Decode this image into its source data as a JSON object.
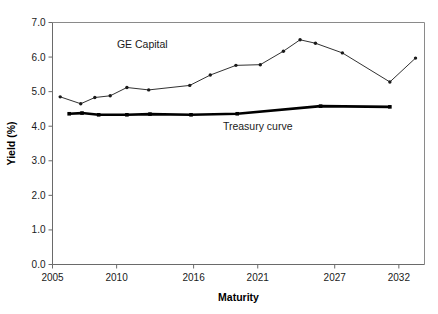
{
  "chart_data": {
    "type": "line",
    "title": "",
    "xlabel": "Maturity",
    "ylabel": "Yield (%)",
    "xlim": [
      2005,
      2034
    ],
    "ylim": [
      0.0,
      7.0
    ],
    "grid": false,
    "legend_position": "inline-annotations",
    "ytick_labels": [
      "0.0",
      "1.0",
      "2.0",
      "3.0",
      "4.0",
      "5.0",
      "6.0",
      "7.0"
    ],
    "ytick_values": [
      0.0,
      1.0,
      2.0,
      3.0,
      4.0,
      5.0,
      6.0,
      7.0
    ],
    "xtick_labels": [
      "2005",
      "2010",
      "2016",
      "2021",
      "2027",
      "2032"
    ],
    "xtick_values": [
      2005,
      2010,
      2016,
      2021,
      2027,
      2032
    ],
    "series": [
      {
        "name": "GE Capital",
        "marker": "dot",
        "line_weight": "thin",
        "color": "#1a1a1a",
        "x": [
          2005.6,
          2007.2,
          2008.3,
          2009.5,
          2010.8,
          2012.5,
          2015.7,
          2017.3,
          2019.3,
          2021.2,
          2023.0,
          2024.3,
          2025.5,
          2027.6,
          2031.3,
          2033.3
        ],
        "y": [
          4.85,
          4.65,
          4.83,
          4.88,
          5.12,
          5.05,
          5.18,
          5.48,
          5.76,
          5.78,
          6.17,
          6.5,
          6.4,
          6.12,
          5.28,
          5.97
        ]
      },
      {
        "name": "Treasury curve",
        "marker": "square",
        "line_weight": "thick",
        "color": "#000000",
        "x": [
          2006.3,
          2007.3,
          2008.6,
          2010.8,
          2012.6,
          2015.8,
          2019.4,
          2025.9,
          2031.3
        ],
        "y": [
          4.36,
          4.38,
          4.33,
          4.33,
          4.35,
          4.33,
          4.36,
          4.58,
          4.56
        ]
      }
    ],
    "annotations": [
      {
        "text": "GE Capital",
        "x": 2012.0,
        "y": 6.25
      },
      {
        "text": "Treasury curve",
        "x": 2021.0,
        "y": 3.88
      }
    ]
  }
}
